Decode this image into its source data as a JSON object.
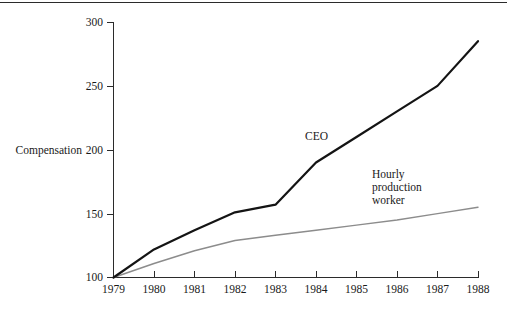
{
  "chart_data": {
    "type": "line",
    "title": "",
    "subtitle": "",
    "xlabel": "",
    "ylabel": "Compensation",
    "x": [
      1979,
      1980,
      1981,
      1982,
      1983,
      1984,
      1985,
      1986,
      1987,
      1988
    ],
    "xtick_labels": [
      "1979",
      "1980",
      "1981",
      "1982",
      "1983",
      "1984",
      "1985",
      "1986",
      "1987",
      "1988"
    ],
    "xlim": [
      1979,
      1988
    ],
    "ylim": [
      100,
      300
    ],
    "ytick_values": [
      100,
      150,
      200,
      250,
      300
    ],
    "ytick_labels": [
      "100",
      "150",
      "200",
      "250",
      "300"
    ],
    "grid": false,
    "legend_position": "inline-annotation",
    "series": [
      {
        "name": "CEO",
        "color": "#141414",
        "style": "thick-solid",
        "values": [
          100,
          122,
          137,
          151,
          157,
          190,
          210,
          230,
          250,
          285
        ]
      },
      {
        "name": "Hourly production worker",
        "color": "#8c8c8c",
        "style": "thin-solid",
        "values": [
          100,
          111,
          121,
          129,
          133,
          137,
          141,
          145,
          150,
          155
        ]
      }
    ],
    "annotations": [
      {
        "id": "ceo",
        "text": "CEO",
        "lines": [
          "CEO"
        ],
        "x_px": 305,
        "y_px": 136
      },
      {
        "id": "hourly",
        "text": "Hourly production worker",
        "lines": [
          "Hourly",
          "production",
          "worker"
        ],
        "x_px": 372,
        "y_px": 176
      }
    ]
  },
  "axis": {
    "y_title": "Compensation",
    "y_ticks": [
      "300",
      "250",
      "200",
      "150",
      "100"
    ],
    "x_ticks": [
      "1979",
      "1980",
      "1981",
      "1982",
      "1983",
      "1984",
      "1985",
      "1986",
      "1987",
      "1988"
    ]
  },
  "annotations": {
    "ceo_label": "CEO",
    "hourly_line1": "Hourly",
    "hourly_line2": "production",
    "hourly_line3": "worker"
  },
  "colors": {
    "ceo_line": "#141414",
    "hourly_line": "#8c8c8c",
    "axis": "#2b2b2b",
    "text": "#1a1a1a",
    "background": "#ffffff"
  }
}
